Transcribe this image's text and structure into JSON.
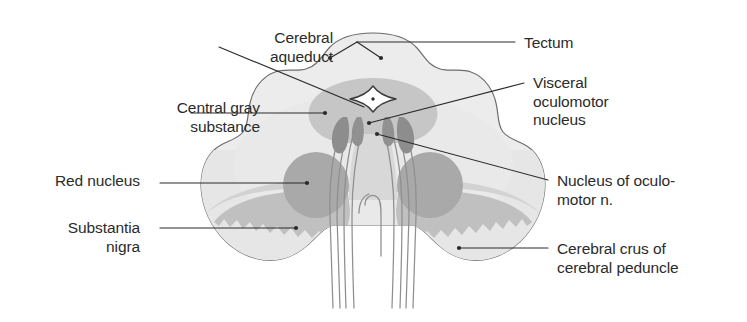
{
  "figure": {
    "type": "anatomical-cross-section",
    "background_color": "#ffffff",
    "palette": {
      "outline": "#6b6b6b",
      "parenchyma_fill": "#ececec",
      "crus_fill": "#e3e3e3",
      "central_gray": "#c6c6c6",
      "red_nucleus": "#a9a9a9",
      "substantia_nigra": "#c0c0c0",
      "oculomotor_nucleus": "#8d8d8d",
      "visceral_nucleus": "#919191",
      "aqueduct_fill": "#ffffff",
      "aqueduct_stroke": "#3a3a3a",
      "fiber_stroke": "#8f8f8f",
      "leader_line": "#2b2b2b",
      "label_text": "#2b2b2b"
    }
  },
  "labels": {
    "cerebral_aqueduct": {
      "text": "Cerebral\naqueduct",
      "side": "left",
      "x": 128,
      "y": 29,
      "width": 205
    },
    "central_gray_substance": {
      "text": "Central gray\nsubstance",
      "side": "left",
      "x": 55,
      "y": 99,
      "width": 205
    },
    "red_nucleus": {
      "text": "Red nucleus",
      "side": "left",
      "x": 40,
      "y": 172,
      "width": 135
    },
    "substantia_nigra": {
      "text": "Substantia\nnigra",
      "side": "left",
      "x": 55,
      "y": 219,
      "width": 120
    },
    "tectum": {
      "text": "Tectum",
      "side": "right",
      "x": 524,
      "y": 34,
      "width": 120
    },
    "visceral_oculomotor_nucleus": {
      "text": "Visceral\noculomotor\nnucleus",
      "side": "right",
      "x": 533,
      "y": 74,
      "width": 150
    },
    "nucleus_of_oculomotor_n": {
      "text": "Nucleus of oculo-\nmotor n.",
      "side": "right",
      "x": 557,
      "y": 172,
      "width": 185
    },
    "cerebral_crus_of_cerebral_peduncle": {
      "text": "Cerebral crus of\ncerebral peduncle",
      "side": "right",
      "x": 557,
      "y": 240,
      "width": 190
    }
  },
  "leaders": [
    {
      "name": "leader-cerebral-aqueduct",
      "from_label": "cerebral_aqueduct",
      "points": "219,47 352,102",
      "endpoint": null
    },
    {
      "name": "leader-central-gray-substance",
      "from_label": "central_gray_substance",
      "points": "191,113 325,113",
      "endpoint": "325,113"
    },
    {
      "name": "leader-red-nucleus",
      "from_label": "red_nucleus",
      "points": "160,183 307,183",
      "endpoint": "307,183"
    },
    {
      "name": "leader-substantia-nigra",
      "from_label": "substantia_nigra",
      "points": "160,228 296,228",
      "endpoint": "296,228"
    },
    {
      "name": "leader-tectum",
      "from_label": "tectum",
      "points": "515,42 357,42",
      "endpoint": null,
      "fork": [
        "357,42 330,58",
        "357,42 381,58"
      ],
      "fork_endpoints": [
        "330,58",
        "381,58"
      ]
    },
    {
      "name": "leader-visceral-oculomotor-nucleus",
      "from_label": "visceral_oculomotor_nucleus",
      "points": "524,83 369,123",
      "endpoint": "369,123"
    },
    {
      "name": "leader-nucleus-of-oculomotor-n",
      "from_label": "nucleus_of_oculomotor_n",
      "points": "548,180 375,134",
      "endpoint": "375,134"
    },
    {
      "name": "leader-cerebral-crus",
      "from_label": "cerebral_crus_of_cerebral_peduncle",
      "points": "548,248 459,248",
      "endpoint": "459,248"
    }
  ],
  "structures": [
    {
      "name": "tectum",
      "label_ref": "tectum"
    },
    {
      "name": "cerebral-aqueduct",
      "label_ref": "cerebral_aqueduct"
    },
    {
      "name": "central-gray-substance",
      "label_ref": "central_gray_substance"
    },
    {
      "name": "red-nucleus-left",
      "label_ref": "red_nucleus"
    },
    {
      "name": "red-nucleus-right",
      "label_ref": "red_nucleus"
    },
    {
      "name": "substantia-nigra-left",
      "label_ref": "substantia_nigra"
    },
    {
      "name": "substantia-nigra-right",
      "label_ref": "substantia_nigra"
    },
    {
      "name": "visceral-oculomotor-nucleus",
      "label_ref": "visceral_oculomotor_nucleus"
    },
    {
      "name": "oculomotor-nucleus",
      "label_ref": "nucleus_of_oculomotor_n"
    },
    {
      "name": "cerebral-crus-left",
      "label_ref": "cerebral_crus_of_cerebral_peduncle"
    },
    {
      "name": "cerebral-crus-right",
      "label_ref": "cerebral_crus_of_cerebral_peduncle"
    },
    {
      "name": "oculomotor-nerve-fibers",
      "label_ref": null
    }
  ]
}
